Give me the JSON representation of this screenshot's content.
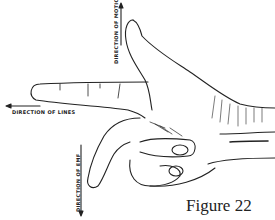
{
  "figure": {
    "caption": "Figure 22"
  },
  "labels": {
    "motion": "DIRECTION OF MOTION",
    "lines": "DIRECTION OF LINES",
    "emf": "DIRECTION OF EMF"
  },
  "colors": {
    "ink": "#222222",
    "background": "#ffffff"
  }
}
